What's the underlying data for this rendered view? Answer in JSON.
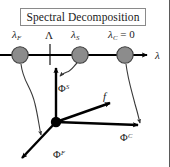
{
  "figure": {
    "title": "Spectral Decomposition",
    "width": 170,
    "height": 167,
    "background": "#ffffff",
    "border_color": "#5a5a5a"
  },
  "axis": {
    "name": "lambda-axis",
    "label": "λ",
    "label_x": 155,
    "label_y": 50,
    "line_y": 55,
    "line_x_start": 0,
    "line_x_end": 148,
    "arrow_x": 148,
    "color": "#000000",
    "tick": {
      "name": "capital-lambda-tick",
      "x": 50,
      "y_top": 45,
      "y_bottom": 65
    }
  },
  "eigenvalues": [
    {
      "id": "lambda-F",
      "label_main": "λ",
      "label_sub": "F",
      "label_suffix": "",
      "x": 20,
      "y": 55,
      "r": 8,
      "fill": "#8c8c8c",
      "stroke": "#3a3a3a"
    },
    {
      "id": "lambda-S",
      "label_main": "λ",
      "label_sub": "S",
      "label_suffix": "",
      "x": 80,
      "y": 55,
      "r": 8,
      "fill": "#8c8c8c",
      "stroke": "#3a3a3a"
    },
    {
      "id": "lambda-C",
      "label_main": "λ",
      "label_sub": "C",
      "label_suffix": " = 0",
      "x": 125,
      "y": 55,
      "r": 8,
      "fill": "#8c8c8c",
      "stroke": "#3a3a3a"
    }
  ],
  "tick_label": {
    "id": "capital-lambda",
    "text": "Λ"
  },
  "origin": {
    "name": "vector-origin-dot",
    "x": 56,
    "y": 122,
    "r": 5,
    "fill": "#000000"
  },
  "vectors": [
    {
      "id": "phi-S-vector",
      "label_main": "Φ",
      "label_sup": "S",
      "from": [
        56,
        122
      ],
      "to": [
        56,
        66
      ],
      "label_x": 58,
      "label_y": 84,
      "color": "#000000"
    },
    {
      "id": "f-vector",
      "label_main": "f",
      "label_sup": "",
      "from": [
        56,
        122
      ],
      "to": [
        112,
        102
      ],
      "label_x": 103,
      "label_y": 91,
      "color": "#000000"
    },
    {
      "id": "phi-C-vector",
      "label_main": "Φ",
      "label_sup": "C",
      "from": [
        56,
        122
      ],
      "to": [
        140,
        125
      ],
      "label_x": 120,
      "label_y": 133,
      "color": "#000000"
    },
    {
      "id": "phi-F-vector",
      "label_main": "Φ",
      "label_sup": "F",
      "from": [
        56,
        122
      ],
      "to": [
        20,
        160
      ],
      "label_x": 53,
      "label_y": 150,
      "color": "#000000"
    }
  ],
  "mapping_arrows": [
    {
      "id": "map-F-arrow",
      "path": "M 21 64 C 23 82, 30 86, 35 104 C 38 116, 39 124, 41 136",
      "head": [
        41,
        137
      ],
      "head_angle": 80,
      "color": "#333333"
    },
    {
      "id": "map-S-arrow",
      "path": "M 76 62 C 72 66, 70 70, 66 72 C 64 73, 62 74, 60 75",
      "head": [
        58,
        76
      ],
      "head_angle": 205,
      "color": "#333333"
    },
    {
      "id": "map-C-arrow",
      "path": "M 126 64 C 127 80, 131 92, 134 104 C 137 114, 139 118, 140 124",
      "head": [
        140,
        125
      ],
      "head_angle": 80,
      "color": "#333333"
    }
  ]
}
